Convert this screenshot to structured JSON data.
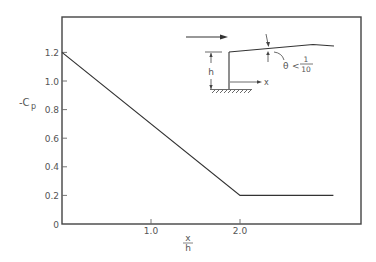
{
  "chart_data": {
    "type": "line",
    "title": "",
    "xlabel": "x/h",
    "xlabel_numerator": "x",
    "xlabel_denominator": "h",
    "ylabel": "-Cp",
    "ylabel_main": "-C",
    "ylabel_sub": "p",
    "xlim": [
      0,
      3.3
    ],
    "ylim": [
      0,
      1.4
    ],
    "x_ticks": [
      1.0,
      2.0
    ],
    "x_tick_labels": [
      "1.0",
      "2.0"
    ],
    "y_ticks": [
      0,
      0.2,
      0.4,
      0.6,
      0.8,
      1.0,
      1.2
    ],
    "y_tick_labels": [
      "0",
      "0.2",
      "0.4",
      "0.6",
      "0.8",
      "1.0",
      "1.2"
    ],
    "grid": false,
    "legend": null,
    "series": [
      {
        "name": "-Cp",
        "x": [
          0.0,
          2.0,
          3.05
        ],
        "y": [
          1.2,
          0.2,
          0.2
        ]
      }
    ],
    "inset_diagram": {
      "description": "Wind flow over a building with a slightly sloped roof",
      "labels": {
        "height": "h",
        "x_axis": "x",
        "angle": "θ",
        "angle_relation": "<",
        "angle_numerator": "1",
        "angle_denominator": "10"
      },
      "wind_arrow": true
    }
  }
}
